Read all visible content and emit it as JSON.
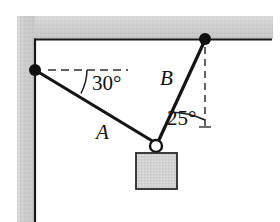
{
  "figure": {
    "colors": {
      "wall_hatch": "#c9c9c9",
      "wall_hatch_light": "#d6d6d6",
      "structure_line": "#1a1a1a",
      "cable": "#141414",
      "block_fill": "#d2d2d2",
      "block_stroke": "#2a2a2a",
      "dashed_guide": "#333333",
      "background": "#ffffff",
      "text": "#111111"
    },
    "labels": {
      "cable_a": "A",
      "cable_b": "B",
      "angle_a": "30°",
      "angle_b": "25°"
    },
    "geometry": {
      "wall_pin": {
        "x": 35,
        "y": 70
      },
      "ceiling_pin": {
        "x": 205,
        "y": 39
      },
      "ring": {
        "x": 156,
        "y": 146
      },
      "block": {
        "x": 136,
        "y": 153,
        "width": 41,
        "height": 36
      },
      "corner": {
        "x": 35,
        "y": 39
      },
      "ceiling_right_end": {
        "x": 272,
        "y": 39
      },
      "wall_bottom": {
        "x": 35,
        "y": 222
      },
      "horizontal_guide": {
        "x1": 48,
        "y1": 70,
        "x2": 128,
        "y2": 70
      },
      "vertical_guide": {
        "x1": 205,
        "y1": 47,
        "x2": 205,
        "y2": 128
      },
      "angle_a_degrees": 30,
      "angle_b_degrees": 25
    }
  }
}
